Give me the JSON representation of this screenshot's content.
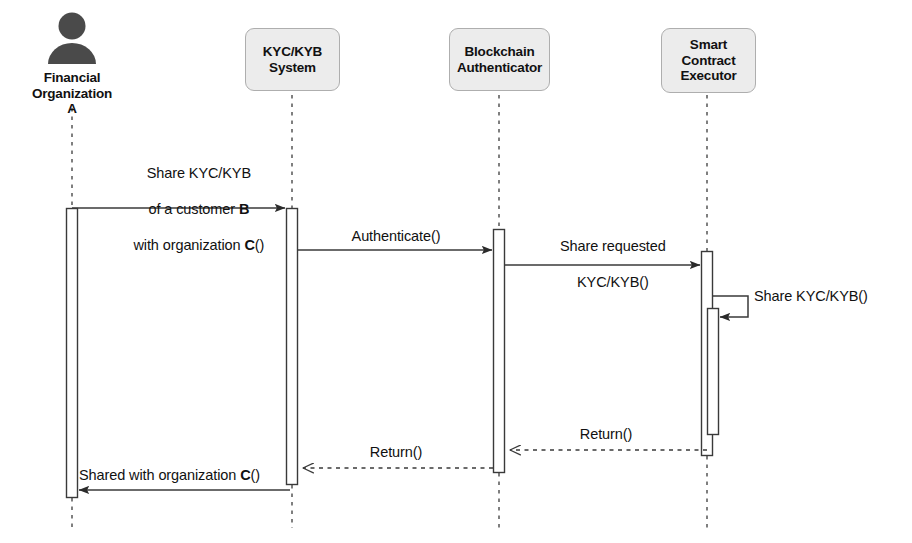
{
  "diagram": {
    "type": "uml-sequence-diagram",
    "canvas": {
      "width": 912,
      "height": 543
    },
    "colors": {
      "box_fill": "#ececec",
      "box_border": "#aeaeae",
      "line": "#3a3a3a",
      "text": "#111111",
      "actor_fill": "#4a4a4a",
      "background": "#ffffff"
    }
  },
  "participants": [
    {
      "id": "financial-organization-a",
      "kind": "actor",
      "label": "Financial\nOrganization\nA",
      "icon": "person-icon",
      "lifeline_x": 72
    },
    {
      "id": "kyc-kyb-system",
      "kind": "box",
      "label": "KYC/KYB\nSystem",
      "lifeline_x": 292
    },
    {
      "id": "blockchain-authenticator",
      "kind": "box",
      "label": "Blockchain\nAuthenticator",
      "lifeline_x": 499
    },
    {
      "id": "smart-contract-executor",
      "kind": "box",
      "label": "Smart\nContract\nExecutor",
      "lifeline_x": 707
    }
  ],
  "messages": [
    {
      "id": "msg-share-kyc-kyb",
      "order": 1,
      "from": "financial-organization-a",
      "to": "kyc-kyb-system",
      "style": "solid-filled-arrow",
      "direction": "right",
      "label_lines": [
        "Share KYC/KYB",
        "of a customer B",
        "with organization C()"
      ],
      "label_plain": "Share KYC/KYB of a customer B with organization C()"
    },
    {
      "id": "msg-authenticate",
      "order": 2,
      "from": "kyc-kyb-system",
      "to": "blockchain-authenticator",
      "style": "solid-filled-arrow",
      "direction": "right",
      "label_lines": [
        "Authenticate()"
      ],
      "label_plain": "Authenticate()"
    },
    {
      "id": "msg-share-requested",
      "order": 3,
      "from": "blockchain-authenticator",
      "to": "smart-contract-executor",
      "style": "solid-filled-arrow",
      "direction": "right",
      "label_lines": [
        "Share requested",
        "KYC/KYB()"
      ],
      "label_plain": "Share requested KYC/KYB()"
    },
    {
      "id": "msg-self-share",
      "order": 4,
      "from": "smart-contract-executor",
      "to": "smart-contract-executor",
      "style": "solid-filled-arrow-self",
      "direction": "self",
      "label_lines": [
        "Share KYC/KYB()"
      ],
      "label_plain": "Share KYC/KYB()"
    },
    {
      "id": "msg-return-sce-to-ba",
      "order": 5,
      "from": "smart-contract-executor",
      "to": "blockchain-authenticator",
      "style": "dashed-open-arrow",
      "direction": "left",
      "label_lines": [
        "Return()"
      ],
      "label_plain": "Return()"
    },
    {
      "id": "msg-return-ba-to-kyc",
      "order": 6,
      "from": "blockchain-authenticator",
      "to": "kyc-kyb-system",
      "style": "dashed-open-arrow",
      "direction": "left",
      "label_lines": [
        "Return()"
      ],
      "label_plain": "Return()"
    },
    {
      "id": "msg-shared-with-organization",
      "order": 7,
      "from": "kyc-kyb-system",
      "to": "financial-organization-a",
      "style": "solid-filled-arrow",
      "direction": "left",
      "label_lines": [
        "Shared with organization C()"
      ],
      "label_plain": "Shared with organization C()"
    }
  ]
}
